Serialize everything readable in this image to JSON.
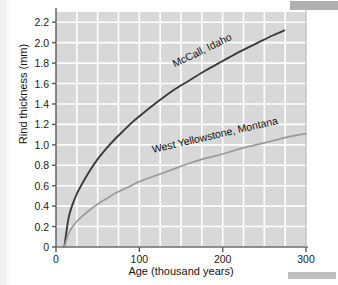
{
  "chart_data": {
    "type": "line",
    "title": "",
    "xlabel": "Age (thousand years)",
    "ylabel": "Rind thickness (mm)",
    "xlim": [
      0,
      300
    ],
    "ylim": [
      0,
      2.3
    ],
    "xticks": [
      "0",
      "100",
      "200",
      "300"
    ],
    "xtick_values": [
      0,
      100,
      200,
      300
    ],
    "yticks": [
      "0",
      "0.2",
      "0.4",
      "0.6",
      "0.8",
      "1.0",
      "1.2",
      "1.4",
      "1.6",
      "1.8",
      "2.0",
      "2.2"
    ],
    "ytick_values": [
      0,
      0.2,
      0.4,
      0.6,
      0.8,
      1.0,
      1.2,
      1.4,
      1.6,
      1.8,
      2.0,
      2.2
    ],
    "grid": true,
    "grid_color": "#ffffff",
    "plot_background": "#d8d8d8",
    "legend_position": "inline-curve-labels",
    "series": [
      {
        "name": "McCall, Idaho",
        "color": "#3a3a3a",
        "label_rotation_deg": -26,
        "x": [
          10,
          15,
          20,
          25,
          30,
          40,
          50,
          60,
          70,
          80,
          90,
          100,
          120,
          140,
          160,
          180,
          200,
          220,
          240,
          260,
          274
        ],
        "values": [
          0.0,
          0.28,
          0.42,
          0.52,
          0.6,
          0.74,
          0.86,
          0.96,
          1.05,
          1.13,
          1.21,
          1.28,
          1.41,
          1.53,
          1.63,
          1.73,
          1.82,
          1.91,
          1.99,
          2.07,
          2.12
        ]
      },
      {
        "name": "West Yellowstone, Montana",
        "color": "#9a9a9a",
        "label_rotation_deg": -13,
        "x": [
          10,
          15,
          20,
          25,
          30,
          40,
          50,
          60,
          70,
          80,
          90,
          100,
          120,
          140,
          160,
          180,
          200,
          220,
          240,
          260,
          280,
          300
        ],
        "values": [
          0.0,
          0.13,
          0.2,
          0.25,
          0.29,
          0.36,
          0.42,
          0.47,
          0.52,
          0.56,
          0.6,
          0.64,
          0.7,
          0.76,
          0.82,
          0.87,
          0.91,
          0.96,
          1.0,
          1.04,
          1.08,
          1.11
        ]
      }
    ]
  },
  "axes": {
    "axis_color": "#6e6e6e",
    "tick_color": "#5a5a5a"
  }
}
